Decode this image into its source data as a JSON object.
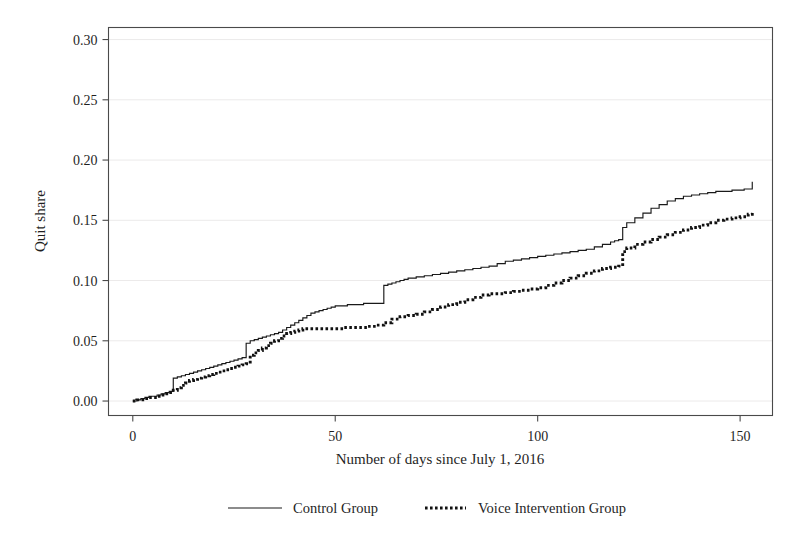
{
  "chart_data": {
    "type": "line",
    "title": "",
    "subtitle": "",
    "xlabel": "Number of days since July 1, 2016",
    "ylabel": "Quit share",
    "xlim": [
      -6,
      158
    ],
    "ylim": [
      -0.012,
      0.31
    ],
    "xticks": [
      0,
      50,
      100,
      150
    ],
    "xtick_labels": [
      "0",
      "50",
      "100",
      "150"
    ],
    "yticks": [
      0.0,
      0.05,
      0.1,
      0.15,
      0.2,
      0.25,
      0.3
    ],
    "ytick_labels": [
      "0.00",
      "0.05",
      "0.10",
      "0.15",
      "0.20",
      "0.25",
      "0.30"
    ],
    "grid": "horizontal",
    "legend_position": "below",
    "step_style": "post",
    "series": [
      {
        "name": "Control Group",
        "style": "solid",
        "color": "#1a1a1a",
        "x": [
          0,
          1,
          2,
          3,
          4,
          5,
          6,
          7,
          8,
          9,
          10,
          11,
          12,
          13,
          14,
          15,
          16,
          17,
          18,
          19,
          20,
          21,
          22,
          23,
          24,
          25,
          26,
          27,
          28,
          29,
          30,
          31,
          32,
          33,
          34,
          35,
          36,
          37,
          38,
          39,
          40,
          41,
          42,
          43,
          44,
          45,
          46,
          47,
          48,
          49,
          50,
          51,
          52,
          53,
          54,
          55,
          56,
          57,
          58,
          59,
          60,
          61,
          62,
          63,
          64,
          65,
          66,
          67,
          68,
          70,
          72,
          74,
          76,
          78,
          80,
          82,
          84,
          86,
          88,
          90,
          92,
          94,
          96,
          98,
          100,
          102,
          104,
          106,
          108,
          110,
          112,
          114,
          116,
          118,
          119,
          120,
          121,
          122,
          124,
          126,
          128,
          130,
          132,
          134,
          136,
          138,
          140,
          142,
          144,
          146,
          148,
          150,
          151,
          152,
          153
        ],
        "y": [
          0.0,
          0.001,
          0.002,
          0.003,
          0.004,
          0.004,
          0.005,
          0.006,
          0.007,
          0.008,
          0.019,
          0.02,
          0.021,
          0.022,
          0.023,
          0.024,
          0.025,
          0.026,
          0.027,
          0.028,
          0.029,
          0.03,
          0.031,
          0.032,
          0.033,
          0.034,
          0.035,
          0.036,
          0.048,
          0.05,
          0.051,
          0.052,
          0.053,
          0.054,
          0.055,
          0.056,
          0.057,
          0.059,
          0.061,
          0.063,
          0.065,
          0.067,
          0.069,
          0.071,
          0.073,
          0.074,
          0.075,
          0.076,
          0.077,
          0.078,
          0.079,
          0.079,
          0.079,
          0.08,
          0.08,
          0.08,
          0.08,
          0.081,
          0.081,
          0.081,
          0.081,
          0.081,
          0.096,
          0.097,
          0.098,
          0.099,
          0.1,
          0.101,
          0.102,
          0.103,
          0.104,
          0.105,
          0.106,
          0.107,
          0.108,
          0.109,
          0.11,
          0.111,
          0.112,
          0.114,
          0.116,
          0.117,
          0.118,
          0.119,
          0.12,
          0.121,
          0.122,
          0.123,
          0.124,
          0.125,
          0.126,
          0.128,
          0.13,
          0.132,
          0.133,
          0.134,
          0.144,
          0.148,
          0.152,
          0.156,
          0.16,
          0.163,
          0.166,
          0.168,
          0.17,
          0.171,
          0.172,
          0.173,
          0.174,
          0.174,
          0.175,
          0.175,
          0.176,
          0.176,
          0.182
        ]
      },
      {
        "name": "Voice Intervention Group",
        "style": "dotted",
        "color": "#111111",
        "x": [
          0,
          1,
          2,
          3,
          4,
          5,
          6,
          7,
          8,
          9,
          10,
          11,
          12,
          13,
          14,
          15,
          16,
          17,
          18,
          19,
          20,
          21,
          22,
          23,
          24,
          25,
          26,
          27,
          28,
          29,
          30,
          31,
          32,
          33,
          34,
          35,
          36,
          37,
          38,
          39,
          40,
          41,
          42,
          43,
          44,
          45,
          46,
          47,
          48,
          50,
          52,
          54,
          56,
          58,
          60,
          62,
          64,
          66,
          68,
          70,
          72,
          74,
          76,
          78,
          80,
          82,
          84,
          86,
          88,
          90,
          92,
          94,
          96,
          98,
          100,
          102,
          104,
          106,
          108,
          110,
          112,
          114,
          116,
          118,
          119,
          120,
          121,
          122,
          124,
          126,
          128,
          130,
          132,
          134,
          136,
          138,
          140,
          142,
          144,
          146,
          148,
          150,
          152,
          153
        ],
        "y": [
          0.0,
          0.001,
          0.001,
          0.002,
          0.003,
          0.003,
          0.004,
          0.005,
          0.006,
          0.007,
          0.009,
          0.011,
          0.013,
          0.015,
          0.017,
          0.018,
          0.019,
          0.02,
          0.021,
          0.022,
          0.023,
          0.024,
          0.025,
          0.026,
          0.027,
          0.028,
          0.029,
          0.03,
          0.031,
          0.038,
          0.04,
          0.042,
          0.044,
          0.046,
          0.048,
          0.05,
          0.052,
          0.054,
          0.056,
          0.057,
          0.058,
          0.059,
          0.06,
          0.06,
          0.06,
          0.06,
          0.06,
          0.06,
          0.06,
          0.06,
          0.061,
          0.061,
          0.061,
          0.062,
          0.063,
          0.065,
          0.068,
          0.07,
          0.071,
          0.072,
          0.074,
          0.076,
          0.078,
          0.08,
          0.082,
          0.084,
          0.086,
          0.088,
          0.089,
          0.089,
          0.09,
          0.091,
          0.092,
          0.093,
          0.094,
          0.096,
          0.098,
          0.1,
          0.102,
          0.104,
          0.106,
          0.108,
          0.11,
          0.111,
          0.111,
          0.112,
          0.124,
          0.127,
          0.13,
          0.132,
          0.134,
          0.136,
          0.138,
          0.14,
          0.142,
          0.144,
          0.146,
          0.148,
          0.15,
          0.151,
          0.152,
          0.153,
          0.155,
          0.157
        ]
      }
    ],
    "legend": [
      {
        "label": "Control Group",
        "style": "solid"
      },
      {
        "label": "Voice Intervention Group",
        "style": "dotted"
      }
    ]
  }
}
